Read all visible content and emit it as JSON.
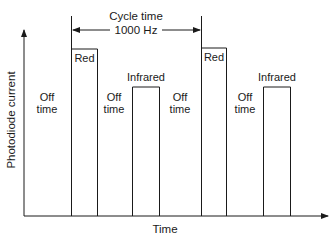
{
  "diagram": {
    "y_axis_label": "Photodiode current",
    "x_axis_label": "Time",
    "cycle": {
      "title": "Cycle time",
      "frequency": "1000 Hz"
    },
    "pulses": [
      {
        "label": "Red"
      },
      {
        "label": "Infrared"
      },
      {
        "label": "Red"
      },
      {
        "label": "Infrared"
      }
    ],
    "off_periods": [
      {
        "line1": "Off",
        "line2": "time"
      },
      {
        "line1": "Off",
        "line2": "time"
      },
      {
        "line1": "Off",
        "line2": "time"
      },
      {
        "line1": "Off",
        "line2": "time"
      }
    ],
    "colors": {
      "line": "#1a1a1a",
      "background": "#ffffff"
    }
  }
}
